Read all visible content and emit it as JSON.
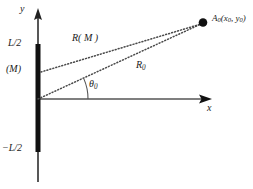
{
  "figure": {
    "axes": {
      "y_axis_label": "y",
      "x_axis_label": "x",
      "origin": {
        "x": 38,
        "y": 99
      }
    },
    "aperture": {
      "name": "line-aperture",
      "top_label": "L/2",
      "center_label": "(M)",
      "bottom_label": "−L/2",
      "color": "#111111",
      "top_y": 44,
      "bottom_y": 152,
      "x": 38,
      "width": 5
    },
    "rays": [
      {
        "name": "ray-R-M",
        "label": "R",
        "label_arg": "( M )",
        "from": {
          "x": 40,
          "y": 72
        },
        "to": {
          "x": 203,
          "y": 23
        },
        "style": "dotted"
      },
      {
        "name": "ray-R-0",
        "label": "R",
        "label_sub": "0",
        "from": {
          "x": 38,
          "y": 99
        },
        "to": {
          "x": 203,
          "y": 23
        },
        "style": "dotted"
      }
    ],
    "angle": {
      "name": "theta-0",
      "symbol": "θ",
      "subscript": "0",
      "vertex": {
        "x": 38,
        "y": 99
      },
      "value_deg": 25
    },
    "observation_point": {
      "name": "point-A0",
      "label_main": "A",
      "label_sub": "0",
      "label_coords": "(x",
      "coord_sub_1": "0",
      "coord_mid": ", y",
      "coord_sub_2": "0",
      "coord_close": ")",
      "x": 203,
      "y": 23,
      "radius": 4,
      "color": "#111111"
    },
    "colors": {
      "stroke": "#1a1a1a",
      "axis": "#3a3a3a",
      "dotted": "#4a4a4a",
      "background": "#ffffff"
    }
  }
}
